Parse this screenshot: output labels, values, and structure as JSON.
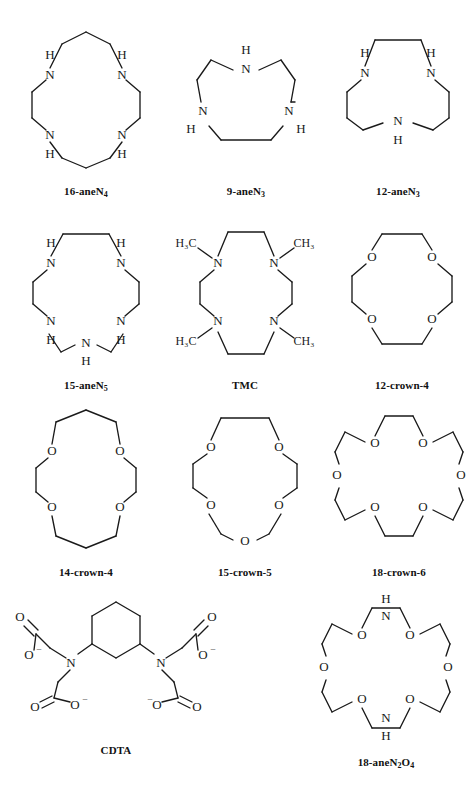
{
  "figure": {
    "background": "#ffffff",
    "line_color": "#1a1a1a",
    "width": 472,
    "height": 798
  },
  "structures": [
    {
      "id": "16-aneN4",
      "caption": "16-aneN",
      "caption_sub": "4",
      "type": "macrocycle",
      "ring_size": 16,
      "heteroatoms": [
        "N",
        "N",
        "N",
        "N"
      ],
      "labels": [
        "H",
        "N",
        "H",
        "N",
        "H",
        "N",
        "H",
        "N"
      ],
      "box": {
        "x": 16,
        "y": 18,
        "w": 140,
        "h": 180
      },
      "svg": {
        "w": 128,
        "h": 150
      }
    },
    {
      "id": "9-aneN3",
      "caption": "9-aneN",
      "caption_sub": "3",
      "type": "macrocycle",
      "ring_size": 9,
      "heteroatoms": [
        "N",
        "N",
        "N"
      ],
      "labels": [
        "H",
        "N",
        "H",
        "N",
        "H",
        "N"
      ],
      "box": {
        "x": 178,
        "y": 18,
        "w": 136,
        "h": 180
      },
      "svg": {
        "w": 110,
        "h": 150
      }
    },
    {
      "id": "12-aneN3",
      "caption": "12-aneN",
      "caption_sub": "3",
      "type": "macrocycle",
      "ring_size": 12,
      "heteroatoms": [
        "N",
        "N",
        "N"
      ],
      "labels": [
        "H",
        "N",
        "H",
        "N",
        "H",
        "N"
      ],
      "box": {
        "x": 330,
        "y": 18,
        "w": 136,
        "h": 180
      },
      "svg": {
        "w": 118,
        "h": 150
      }
    },
    {
      "id": "15-aneN5",
      "caption": "15-aneN",
      "caption_sub": "5",
      "type": "macrocycle",
      "ring_size": 15,
      "heteroatoms": [
        "N",
        "N",
        "N",
        "N",
        "N"
      ],
      "labels": [
        "H",
        "N",
        "H",
        "N",
        "H",
        "N",
        "H",
        "N",
        "H",
        "N"
      ],
      "box": {
        "x": 16,
        "y": 212,
        "w": 140,
        "h": 180
      },
      "svg": {
        "w": 130,
        "h": 152
      }
    },
    {
      "id": "TMC",
      "caption": "TMC",
      "caption_sub": "",
      "type": "macrocycle",
      "ring_size": 14,
      "heteroatoms": [
        "N",
        "N",
        "N",
        "N"
      ],
      "labels": [
        "H3C",
        "CH3",
        "H3C",
        "CH3",
        "N",
        "N",
        "N",
        "N"
      ],
      "methyl_left": "H",
      "methyl_left_sub": "3",
      "methyl_left_tail": "C",
      "methyl_right": "CH",
      "methyl_right_sub": "3",
      "box": {
        "x": 172,
        "y": 212,
        "w": 146,
        "h": 180
      },
      "svg": {
        "w": 146,
        "h": 152
      }
    },
    {
      "id": "12-crown-4",
      "caption": "12-crown-4",
      "caption_sub": "",
      "type": "crown",
      "ring_size": 12,
      "heteroatoms": [
        "O",
        "O",
        "O",
        "O"
      ],
      "labels": [
        "O",
        "O",
        "O",
        "O"
      ],
      "box": {
        "x": 334,
        "y": 212,
        "w": 136,
        "h": 180
      },
      "svg": {
        "w": 120,
        "h": 150
      }
    },
    {
      "id": "14-crown-4",
      "caption": "14-crown-4",
      "caption_sub": "",
      "type": "crown",
      "ring_size": 14,
      "heteroatoms": [
        "O",
        "O",
        "O",
        "O"
      ],
      "labels": [
        "O",
        "O",
        "O",
        "O"
      ],
      "box": {
        "x": 16,
        "y": 400,
        "w": 140,
        "h": 180
      },
      "svg": {
        "w": 120,
        "h": 152
      }
    },
    {
      "id": "15-crown-5",
      "caption": "15-crown-5",
      "caption_sub": "",
      "type": "crown",
      "ring_size": 15,
      "heteroatoms": [
        "O",
        "O",
        "O",
        "O",
        "O"
      ],
      "labels": [
        "O",
        "O",
        "O",
        "O",
        "O"
      ],
      "box": {
        "x": 172,
        "y": 400,
        "w": 146,
        "h": 180
      },
      "svg": {
        "w": 132,
        "h": 152
      }
    },
    {
      "id": "18-crown-6",
      "caption": "18-crown-6",
      "caption_sub": "",
      "type": "crown",
      "ring_size": 18,
      "heteroatoms": [
        "O",
        "O",
        "O",
        "O",
        "O",
        "O"
      ],
      "labels": [
        "O",
        "O",
        "O",
        "O",
        "O",
        "O"
      ],
      "box": {
        "x": 328,
        "y": 400,
        "w": 142,
        "h": 180
      },
      "svg": {
        "w": 140,
        "h": 152
      }
    },
    {
      "id": "CDTA",
      "caption": "CDTA",
      "caption_sub": "",
      "type": "chelator",
      "core": "cyclohexane",
      "labels": [
        "N",
        "N",
        "O",
        "O",
        "O",
        "O"
      ],
      "anion_labels": [
        "O",
        "O",
        "O",
        "O"
      ],
      "charge": "-",
      "box": {
        "x": 0,
        "y": 586,
        "w": 232,
        "h": 160
      },
      "svg": {
        "w": 216,
        "h": 148
      }
    },
    {
      "id": "18-aneN2O4",
      "caption": "18-aneN",
      "caption_sub": "2",
      "caption_tail": "O",
      "caption_sub2": "4",
      "type": "aza-crown",
      "ring_size": 18,
      "heteroatoms": [
        "N",
        "O",
        "O",
        "N",
        "O",
        "O"
      ],
      "labels": [
        "N",
        "H",
        "O",
        "O",
        "N",
        "H",
        "O",
        "O"
      ],
      "box": {
        "x": 300,
        "y": 592,
        "w": 172,
        "h": 180
      },
      "svg": {
        "w": 140,
        "h": 152
      }
    }
  ]
}
